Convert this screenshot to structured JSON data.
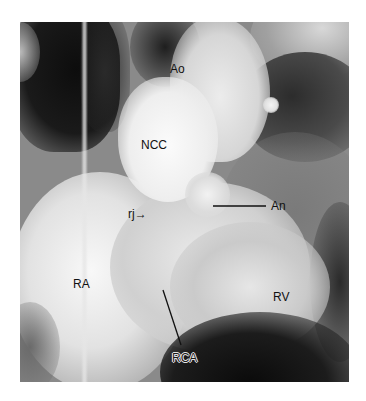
{
  "figure": {
    "type": "coronary/aortic root angiogram (grayscale)",
    "labels": [
      {
        "id": "ao",
        "text": "Ao",
        "meaning": "aorta"
      },
      {
        "id": "ncc",
        "text": "NCC",
        "meaning": "non-coronary cusp"
      },
      {
        "id": "an",
        "text": "An",
        "meaning": "aneurysm"
      },
      {
        "id": "rj",
        "text": "rj→",
        "meaning": "regurgitant jet"
      },
      {
        "id": "ra",
        "text": "RA",
        "meaning": "right atrium"
      },
      {
        "id": "rv",
        "text": "RV",
        "meaning": "right ventricle"
      },
      {
        "id": "rca",
        "text": "RCA",
        "meaning": "right coronary artery"
      }
    ],
    "colors": {
      "background": "#ffffff",
      "label_text": "#111111",
      "pointer_line": "#111111"
    }
  }
}
